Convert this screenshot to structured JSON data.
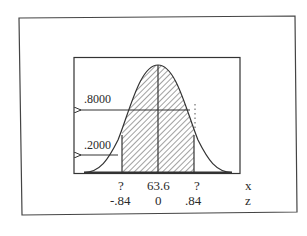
{
  "figure": {
    "type": "normal-distribution-diagram",
    "area_labels": {
      "upper": ".8000",
      "lower": ".2000"
    },
    "x_axis": {
      "row_label": "x",
      "values": [
        "?",
        "63.6",
        "?"
      ]
    },
    "z_axis": {
      "row_label": "z",
      "values": [
        "-.84",
        "0",
        ".84"
      ]
    },
    "shaded_region": {
      "from_z": -0.84,
      "to_z": 0.84,
      "pattern": "diagonal-hatch"
    },
    "colors": {
      "line": "#333333",
      "background": "#ffffff"
    }
  }
}
